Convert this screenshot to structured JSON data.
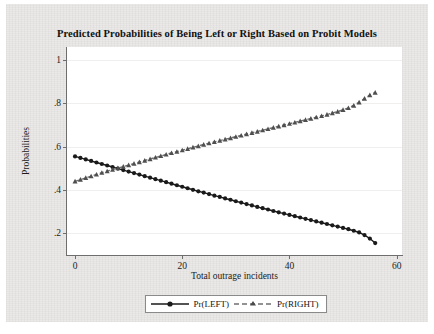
{
  "chart_data": {
    "type": "line",
    "title": "Predicted Probabilities of Being Left or Right Based on Probit Models",
    "xlabel": "Total outrage incidents",
    "ylabel": "Probabilities",
    "xlim": [
      -1.5,
      61
    ],
    "ylim": [
      0.1,
      1.06
    ],
    "xticks": [
      0,
      20,
      40,
      60
    ],
    "xtick_labels": [
      "0",
      "20",
      "40",
      "60"
    ],
    "yticks": [
      0.2,
      0.4,
      0.6,
      0.8,
      1.0
    ],
    "ytick_labels": [
      ".2",
      ".4",
      ".6",
      ".8",
      "1"
    ],
    "grid": "horizontal",
    "legend_position": "below-center",
    "series": [
      {
        "name": "Pr(LEFT)",
        "color": "#1a1a1a",
        "linestyle": "solid",
        "marker": "circle",
        "x": [
          0,
          1,
          2,
          3,
          4,
          5,
          6,
          7,
          8,
          9,
          10,
          11,
          12,
          13,
          14,
          15,
          16,
          17,
          18,
          19,
          20,
          21,
          22,
          23,
          24,
          25,
          26,
          27,
          28,
          29,
          30,
          31,
          32,
          33,
          34,
          35,
          36,
          37,
          38,
          39,
          40,
          41,
          42,
          43,
          44,
          45,
          46,
          47,
          48,
          49,
          50,
          51,
          52,
          53,
          54,
          55,
          56
        ],
        "values": [
          0.555,
          0.548,
          0.541,
          0.534,
          0.527,
          0.52,
          0.513,
          0.506,
          0.499,
          0.492,
          0.485,
          0.478,
          0.471,
          0.464,
          0.457,
          0.45,
          0.443,
          0.436,
          0.429,
          0.422,
          0.415,
          0.408,
          0.401,
          0.394,
          0.388,
          0.381,
          0.374,
          0.368,
          0.361,
          0.355,
          0.348,
          0.342,
          0.335,
          0.329,
          0.322,
          0.316,
          0.31,
          0.303,
          0.297,
          0.291,
          0.285,
          0.279,
          0.273,
          0.267,
          0.261,
          0.255,
          0.249,
          0.243,
          0.237,
          0.231,
          0.225,
          0.219,
          0.212,
          0.204,
          0.192,
          0.176,
          0.155
        ]
      },
      {
        "name": "Pr(RIGHT)",
        "color": "#6f6f6f",
        "linestyle": "dashed",
        "marker": "triangle",
        "x": [
          0,
          1,
          2,
          3,
          4,
          5,
          6,
          7,
          8,
          9,
          10,
          11,
          12,
          13,
          14,
          15,
          16,
          17,
          18,
          19,
          20,
          21,
          22,
          23,
          24,
          25,
          26,
          27,
          28,
          29,
          30,
          31,
          32,
          33,
          34,
          35,
          36,
          37,
          38,
          39,
          40,
          41,
          42,
          43,
          44,
          45,
          46,
          47,
          48,
          49,
          50,
          51,
          52,
          53,
          54,
          55,
          56
        ],
        "values": [
          0.44,
          0.448,
          0.456,
          0.464,
          0.472,
          0.48,
          0.487,
          0.494,
          0.501,
          0.508,
          0.515,
          0.522,
          0.529,
          0.536,
          0.543,
          0.55,
          0.557,
          0.564,
          0.571,
          0.577,
          0.584,
          0.59,
          0.597,
          0.603,
          0.61,
          0.616,
          0.622,
          0.628,
          0.634,
          0.64,
          0.646,
          0.652,
          0.658,
          0.664,
          0.67,
          0.676,
          0.682,
          0.688,
          0.694,
          0.7,
          0.706,
          0.712,
          0.718,
          0.724,
          0.73,
          0.736,
          0.742,
          0.748,
          0.755,
          0.762,
          0.77,
          0.779,
          0.79,
          0.805,
          0.822,
          0.838,
          0.85
        ]
      }
    ]
  },
  "legend": {
    "items": [
      {
        "label": "Pr(LEFT)"
      },
      {
        "label": "Pr(RIGHT)"
      }
    ]
  },
  "colors": {
    "left_series": "#1a1a1a",
    "right_series": "#6f6f6f",
    "panel_background": "#ffffff",
    "paper_background": "#e9e8e6",
    "axis": "#6e6e6e"
  }
}
